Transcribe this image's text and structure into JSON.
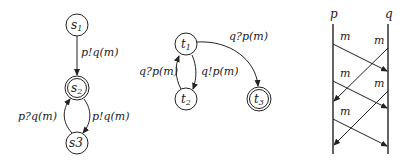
{
  "automaton_s": {
    "states": [
      {
        "id": "s1",
        "name": "s",
        "sub": "1",
        "final": false
      },
      {
        "id": "s2",
        "name": "s",
        "sub": "2",
        "final": true
      },
      {
        "id": "s3",
        "name": "s3",
        "sub": "",
        "final": false
      }
    ],
    "transitions": [
      {
        "from": "s1",
        "to": "s2",
        "label": "p!q(m)"
      },
      {
        "from": "s3",
        "to": "s2",
        "label": "p?q(m)"
      },
      {
        "from": "s2",
        "to": "s3",
        "label": "p!q(m)"
      }
    ]
  },
  "automaton_t": {
    "states": [
      {
        "id": "t1",
        "name": "t",
        "sub": "1",
        "final": false
      },
      {
        "id": "t2",
        "name": "t",
        "sub": "2",
        "final": false
      },
      {
        "id": "t3",
        "name": "t",
        "sub": "3",
        "final": true
      }
    ],
    "transitions": [
      {
        "from": "t1",
        "to": "t3",
        "label": "q?p(m)"
      },
      {
        "from": "t2",
        "to": "t1",
        "label": "q?p(m)"
      },
      {
        "from": "t1",
        "to": "t2",
        "label": "q!p(m)"
      }
    ]
  },
  "msc": {
    "processes": [
      "p",
      "q"
    ],
    "messages": [
      {
        "from": "p",
        "to": "q",
        "label": "m"
      },
      {
        "from": "q",
        "to": "p",
        "label": "m"
      },
      {
        "from": "p",
        "to": "q",
        "label": "m"
      },
      {
        "from": "q",
        "to": "p",
        "label": "m"
      },
      {
        "from": "p",
        "to": "q",
        "label": "m"
      }
    ]
  }
}
